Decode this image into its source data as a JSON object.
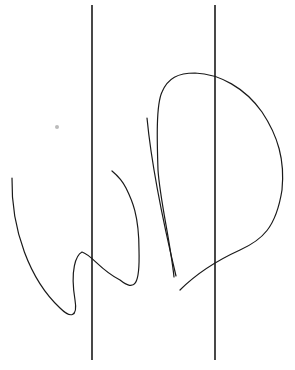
{
  "canvas": {
    "width": 295,
    "height": 370,
    "background": "#ffffff",
    "stroke": "#1a1a1a"
  },
  "vertical_lines": [
    {
      "x": 92,
      "y1": 5,
      "y2": 360
    },
    {
      "x": 215,
      "y1": 5,
      "y2": 360
    }
  ],
  "strokes": [
    {
      "name": "left-s-curve",
      "d": "M12,178 C11,230 30,280 60,308 C70,318 78,318 75,300 C70,270 76,255 82,252 C92,255 100,270 120,280 C135,292 140,285 139,250 C139,215 132,200 126,188 C122,180 118,176 112,171"
    },
    {
      "name": "narrow-v-stroke",
      "d": "M147,118 C152,170 165,230 176,276"
    },
    {
      "name": "big-loop-stroke",
      "d": "M174,277 C170,240 160,200 158,170 C157,140 156,105 162,92 C168,78 178,73 195,73 C220,74 245,88 262,112 C278,136 285,160 282,190 C276,228 262,240 240,250 C218,260 198,272 180,290"
    }
  ],
  "marks": [
    {
      "name": "smudge",
      "x": 57,
      "y": 127,
      "r": 2
    }
  ]
}
